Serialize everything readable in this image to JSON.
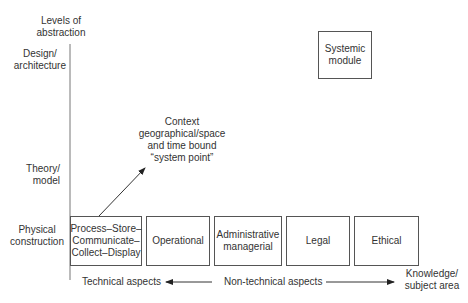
{
  "diagram": {
    "y_axis_title": [
      "Levels of",
      "abstraction"
    ],
    "y_levels": [
      {
        "line1": "Design/",
        "line2": "architecture"
      },
      {
        "line1": "Theory/",
        "line2": "model"
      },
      {
        "line1": "Physical",
        "line2": "construction"
      }
    ],
    "top_box": {
      "line1": "Systemic",
      "line2": "module"
    },
    "context_label": [
      "Context",
      "geographical/space",
      "and time bound",
      "“system point”"
    ],
    "boxes": [
      {
        "lines": [
          "Process–Store–",
          "Communicate–",
          "Collect–Display"
        ]
      },
      {
        "lines": [
          "Operational"
        ]
      },
      {
        "lines": [
          "Administrative",
          "managerial"
        ]
      },
      {
        "lines": [
          "Legal"
        ]
      },
      {
        "lines": [
          "Ethical"
        ]
      }
    ],
    "x_axis": {
      "left_label": "Technical aspects",
      "middle_label": "Non-technical aspects",
      "right_label": [
        "Knowledge/",
        "subject area"
      ]
    }
  }
}
